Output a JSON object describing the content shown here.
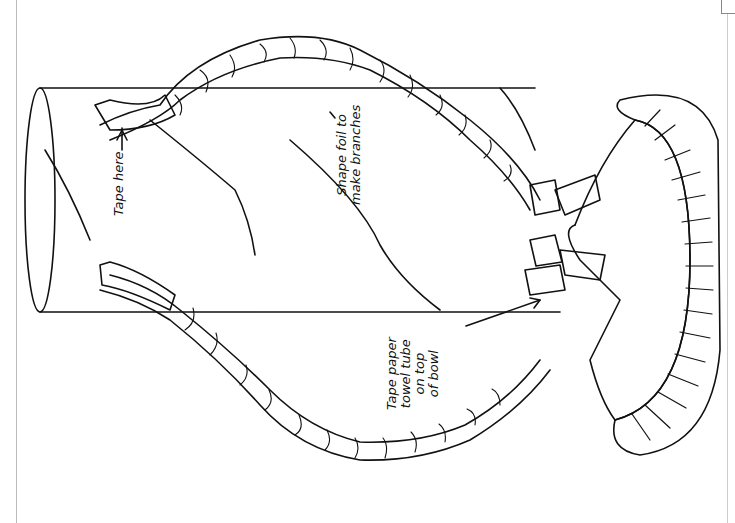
{
  "figure": {
    "orientation": "rotated 90 degrees counter-clockwise",
    "line_color": "#111111",
    "background": "#ffffff"
  },
  "labels": {
    "tape_here": {
      "lines": [
        "Tape here"
      ]
    },
    "shape_foil": {
      "lines": [
        "Shape foil to",
        "make branches"
      ]
    },
    "tape_tube": {
      "lines": [
        "Tape paper",
        "towel tube",
        "on top",
        "of bowl"
      ]
    }
  },
  "parts": [
    "paper towel tube",
    "foil branches",
    "tape strips",
    "bowl"
  ]
}
